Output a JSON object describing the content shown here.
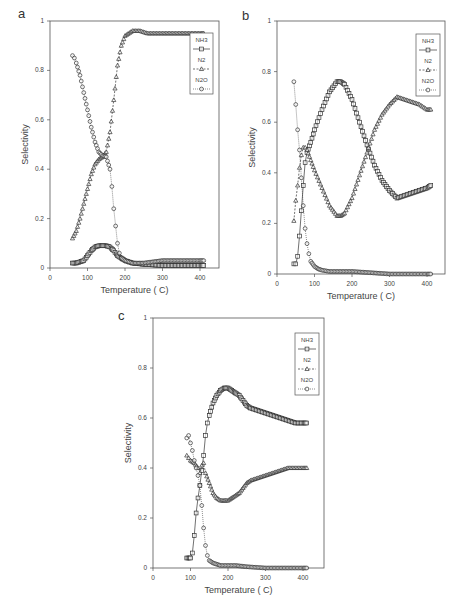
{
  "chart_data": [
    {
      "panel": "a",
      "type": "scatter",
      "title": "",
      "xlabel": "Temperature ( C)",
      "ylabel": "Selectivity",
      "xlim": [
        0,
        450
      ],
      "ylim": [
        0,
        1
      ],
      "xticks": [
        0,
        100,
        200,
        300,
        400
      ],
      "yticks": [
        0,
        0.2,
        0.4,
        0.6,
        0.8,
        1
      ],
      "ytick_labels": [
        "0",
        "0.2",
        "0.4",
        "0.6",
        "0.8",
        "1"
      ],
      "legend": [
        "NH3",
        "N2",
        "N2O"
      ],
      "legend_position": "upper right",
      "series": [
        {
          "name": "NH3",
          "marker": "square",
          "line": "solid",
          "x": [
            60,
            70,
            80,
            90,
            100,
            110,
            120,
            130,
            140,
            150,
            160,
            170,
            180,
            190,
            200,
            220,
            250,
            300,
            350,
            400,
            410
          ],
          "y": [
            0.02,
            0.02,
            0.025,
            0.03,
            0.05,
            0.07,
            0.085,
            0.09,
            0.09,
            0.09,
            0.085,
            0.07,
            0.05,
            0.04,
            0.03,
            0.02,
            0.015,
            0.01,
            0.01,
            0.01,
            0.01
          ]
        },
        {
          "name": "N2",
          "marker": "triangle",
          "line": "dashed",
          "x": [
            60,
            70,
            80,
            90,
            100,
            110,
            120,
            130,
            140,
            150,
            160,
            170,
            180,
            190,
            200,
            220,
            240,
            260,
            300,
            350,
            400,
            410
          ],
          "y": [
            0.12,
            0.15,
            0.2,
            0.26,
            0.32,
            0.38,
            0.42,
            0.44,
            0.45,
            0.47,
            0.55,
            0.68,
            0.82,
            0.9,
            0.94,
            0.96,
            0.96,
            0.95,
            0.95,
            0.95,
            0.95,
            0.95
          ]
        },
        {
          "name": "N2O",
          "marker": "circle",
          "line": "dotted",
          "x": [
            60,
            65,
            70,
            80,
            90,
            100,
            110,
            120,
            130,
            140,
            150,
            160,
            165,
            170,
            175,
            180,
            185,
            190,
            200,
            220,
            250,
            300,
            350,
            400,
            410
          ],
          "y": [
            0.86,
            0.85,
            0.83,
            0.78,
            0.71,
            0.64,
            0.57,
            0.51,
            0.47,
            0.455,
            0.45,
            0.4,
            0.33,
            0.24,
            0.17,
            0.1,
            0.06,
            0.04,
            0.03,
            0.02,
            0.02,
            0.03,
            0.03,
            0.03,
            0.03
          ]
        }
      ]
    },
    {
      "panel": "b",
      "type": "scatter",
      "title": "",
      "xlabel": "Temperature ( C)",
      "ylabel": "Selectivity",
      "xlim": [
        0,
        450
      ],
      "ylim": [
        0,
        1
      ],
      "xticks": [
        0,
        100,
        200,
        300,
        400
      ],
      "yticks": [
        0,
        0.2,
        0.4,
        0.6,
        0.8,
        1
      ],
      "ytick_labels": [
        "0",
        "0.2",
        "0.4",
        "0.6",
        "0.8",
        "1"
      ],
      "legend": [
        "NH3",
        "N2",
        "N2O"
      ],
      "legend_position": "upper right",
      "series": [
        {
          "name": "NH3",
          "marker": "square",
          "line": "solid",
          "x": [
            45,
            50,
            55,
            60,
            65,
            70,
            75,
            80,
            90,
            100,
            120,
            140,
            160,
            170,
            180,
            200,
            220,
            240,
            260,
            280,
            300,
            320,
            340,
            360,
            380,
            400,
            410
          ],
          "y": [
            0.04,
            0.04,
            0.07,
            0.15,
            0.25,
            0.35,
            0.44,
            0.48,
            0.52,
            0.57,
            0.65,
            0.72,
            0.76,
            0.76,
            0.75,
            0.69,
            0.6,
            0.51,
            0.43,
            0.37,
            0.33,
            0.3,
            0.31,
            0.32,
            0.33,
            0.34,
            0.35
          ]
        },
        {
          "name": "N2",
          "marker": "triangle",
          "line": "dashed",
          "x": [
            45,
            50,
            55,
            60,
            65,
            70,
            75,
            80,
            90,
            100,
            120,
            140,
            160,
            170,
            180,
            200,
            220,
            240,
            260,
            280,
            300,
            320,
            340,
            360,
            380,
            400,
            410
          ],
          "y": [
            0.21,
            0.29,
            0.35,
            0.42,
            0.47,
            0.5,
            0.5,
            0.49,
            0.45,
            0.41,
            0.34,
            0.27,
            0.23,
            0.23,
            0.24,
            0.3,
            0.39,
            0.48,
            0.57,
            0.63,
            0.67,
            0.7,
            0.69,
            0.68,
            0.67,
            0.65,
            0.65
          ]
        },
        {
          "name": "N2O",
          "marker": "circle",
          "line": "dotted",
          "x": [
            45,
            50,
            55,
            60,
            65,
            70,
            75,
            80,
            85,
            90,
            100,
            110,
            120,
            140,
            160,
            200,
            250,
            300,
            350,
            400,
            410
          ],
          "y": [
            0.76,
            0.67,
            0.57,
            0.49,
            0.38,
            0.27,
            0.18,
            0.12,
            0.08,
            0.05,
            0.03,
            0.02,
            0.015,
            0.01,
            0.01,
            0.01,
            0.005,
            0.0,
            0.0,
            0.0,
            0.0
          ]
        }
      ]
    },
    {
      "panel": "c",
      "type": "scatter",
      "title": "",
      "xlabel": "Temperature ( C)",
      "ylabel": "Selectivity",
      "xlim": [
        0,
        450
      ],
      "ylim": [
        0,
        1
      ],
      "xticks": [
        0,
        100,
        200,
        300,
        400
      ],
      "yticks": [
        0,
        0.2,
        0.4,
        0.6,
        0.8,
        1
      ],
      "ytick_labels": [
        "0",
        "0.2",
        "0.4",
        "0.6",
        "0.8",
        "1"
      ],
      "legend": [
        "NH3",
        "N2",
        "N2O"
      ],
      "legend_position": "upper right",
      "series": [
        {
          "name": "NH3",
          "marker": "square",
          "line": "solid",
          "x": [
            90,
            100,
            105,
            110,
            115,
            120,
            125,
            130,
            135,
            140,
            145,
            150,
            160,
            170,
            180,
            190,
            200,
            210,
            220,
            230,
            240,
            250,
            260,
            280,
            300,
            320,
            340,
            360,
            380,
            400,
            410
          ],
          "y": [
            0.04,
            0.04,
            0.06,
            0.13,
            0.22,
            0.28,
            0.33,
            0.39,
            0.45,
            0.53,
            0.58,
            0.61,
            0.66,
            0.69,
            0.71,
            0.72,
            0.72,
            0.71,
            0.7,
            0.69,
            0.67,
            0.65,
            0.64,
            0.63,
            0.62,
            0.61,
            0.6,
            0.59,
            0.58,
            0.58,
            0.58
          ]
        },
        {
          "name": "N2",
          "marker": "triangle",
          "line": "dashed",
          "x": [
            90,
            95,
            100,
            110,
            120,
            125,
            130,
            135,
            140,
            150,
            160,
            170,
            180,
            190,
            200,
            210,
            220,
            230,
            240,
            250,
            260,
            280,
            300,
            320,
            340,
            360,
            380,
            400,
            410
          ],
          "y": [
            0.45,
            0.44,
            0.43,
            0.42,
            0.4,
            0.38,
            0.41,
            0.42,
            0.38,
            0.34,
            0.3,
            0.28,
            0.27,
            0.27,
            0.27,
            0.28,
            0.29,
            0.3,
            0.32,
            0.34,
            0.35,
            0.36,
            0.37,
            0.38,
            0.39,
            0.4,
            0.4,
            0.4,
            0.4
          ]
        },
        {
          "name": "N2O",
          "marker": "circle",
          "line": "dotted",
          "x": [
            90,
            95,
            100,
            105,
            110,
            115,
            120,
            125,
            130,
            135,
            140,
            145,
            150,
            160,
            170,
            180,
            200,
            220,
            250,
            300,
            350,
            400,
            410
          ],
          "y": [
            0.52,
            0.53,
            0.5,
            0.47,
            0.43,
            0.4,
            0.37,
            0.33,
            0.25,
            0.16,
            0.09,
            0.05,
            0.03,
            0.02,
            0.015,
            0.01,
            0.01,
            0.01,
            0.005,
            0.0,
            0.0,
            0.0,
            0.0
          ]
        }
      ]
    }
  ],
  "panels": [
    {
      "label": "a"
    },
    {
      "label": "b"
    },
    {
      "label": "c"
    }
  ]
}
